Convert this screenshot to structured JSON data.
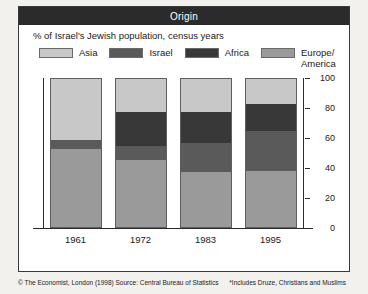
{
  "title": "Origin",
  "subtitle": "% of Israel's Jewish population, census years",
  "footer": {
    "credit": "© The Economist, London (1998) Source: Central Bureau of Statistics",
    "footnote": "*Includes Druze, Christians and Muslims"
  },
  "colors": {
    "asia": "#c8c8c8",
    "israel": "#5a5a5a",
    "africa": "#383838",
    "europe_america": "#9a9a9a",
    "title_bar": "#2b2b2b",
    "axis": "#2b2b2b",
    "panel": "#ffffff",
    "page": "#f2f1ee"
  },
  "chart_data": {
    "type": "bar",
    "stacked": true,
    "title": "Origin",
    "subtitle": "% of Israel's Jewish population, census years",
    "xlabel": "",
    "ylabel": "",
    "ylim": [
      0,
      100
    ],
    "yticks": [
      0,
      20,
      40,
      60,
      80,
      100
    ],
    "grid": false,
    "legend_position": "top",
    "categories": [
      "1961",
      "1972",
      "1983",
      "1995"
    ],
    "stack_order_bottom_to_top": [
      "Europe/America",
      "Israel",
      "Africa",
      "Asia"
    ],
    "series": [
      {
        "name": "Europe/America",
        "color": "#9a9a9a",
        "values": [
          53,
          45,
          37,
          38
        ]
      },
      {
        "name": "Israel",
        "color": "#5a5a5a",
        "values": [
          6,
          10,
          20,
          27
        ]
      },
      {
        "name": "Africa",
        "color": "#383838",
        "values": [
          0,
          23,
          21,
          18
        ]
      },
      {
        "name": "Asia",
        "color": "#c8c8c8",
        "values": [
          41,
          22,
          22,
          17
        ]
      }
    ]
  },
  "legend": [
    {
      "label": "Asia",
      "color": "#c8c8c8"
    },
    {
      "label": "Israel",
      "color": "#5a5a5a"
    },
    {
      "label": "Africa",
      "color": "#383838"
    },
    {
      "label": "Europe/\nAmerica",
      "color": "#9a9a9a"
    }
  ]
}
